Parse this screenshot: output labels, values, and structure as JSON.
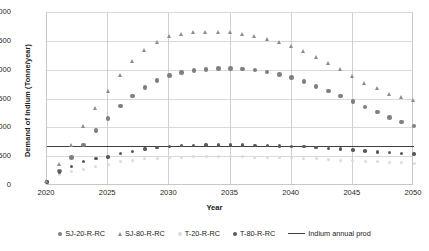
{
  "chart_data": {
    "type": "scatter",
    "title": "",
    "xlabel": "Year",
    "ylabel": "Demand of Indium  (Tonne/year)",
    "xlim": [
      2020,
      2050
    ],
    "ylim": [
      0,
      3000
    ],
    "ytick_step": 500,
    "xtick_step": 5,
    "grid": true,
    "legend_position": "bottom",
    "yticks": [
      "0",
      "500",
      "1000",
      "1500",
      "2000",
      "2500",
      "3000"
    ],
    "xticks": [
      "2020",
      "2025",
      "2030",
      "2035",
      "2040",
      "2045",
      "2050"
    ],
    "x": [
      2020,
      2021,
      2022,
      2023,
      2024,
      2025,
      2026,
      2027,
      2028,
      2029,
      2030,
      2031,
      2032,
      2033,
      2034,
      2035,
      2036,
      2037,
      2038,
      2039,
      2040,
      2041,
      2042,
      2043,
      2044,
      2045,
      2046,
      2047,
      2048,
      2049,
      2050
    ],
    "series": [
      {
        "name": "SJ-20-R-RC",
        "marker": "circle",
        "color": "#7f7f7f",
        "values": [
          70,
          260,
          490,
          710,
          960,
          1170,
          1390,
          1560,
          1710,
          1830,
          1915,
          1965,
          2000,
          2020,
          2035,
          2040,
          2030,
          2010,
          1975,
          1930,
          1880,
          1810,
          1730,
          1650,
          1560,
          1470,
          1370,
          1280,
          1190,
          1110,
          1040
        ]
      },
      {
        "name": "SJ-80-R-RC",
        "marker": "triangle",
        "color": "#8c8c8c",
        "values": [
          75,
          375,
          700,
          1040,
          1350,
          1640,
          1930,
          2160,
          2350,
          2495,
          2590,
          2640,
          2665,
          2670,
          2670,
          2665,
          2640,
          2600,
          2545,
          2490,
          2420,
          2330,
          2230,
          2130,
          2020,
          1910,
          1790,
          1690,
          1600,
          1545,
          1490
        ]
      },
      {
        "name": "T-20-R-RC",
        "marker": "circle",
        "color": "#dcdcdc",
        "values": [
          70,
          195,
          260,
          290,
          330,
          375,
          420,
          450,
          470,
          485,
          495,
          500,
          505,
          505,
          505,
          505,
          503,
          500,
          497,
          493,
          488,
          480,
          470,
          460,
          450,
          440,
          428,
          418,
          408,
          400,
          393
        ]
      },
      {
        "name": "T-80-R-RC",
        "marker": "circle",
        "color": "#595959",
        "values": [
          70,
          245,
          340,
          420,
          480,
          500,
          560,
          600,
          640,
          670,
          690,
          700,
          705,
          708,
          710,
          710,
          708,
          705,
          700,
          696,
          690,
          680,
          668,
          655,
          640,
          625,
          608,
          592,
          578,
          566,
          556
        ]
      }
    ],
    "hline": {
      "name": "Indium annual prod",
      "value": 700,
      "color": "#3f3f3f"
    },
    "legend": [
      {
        "label": "SJ-20-R-RC",
        "marker": "circle",
        "color": "#7f7f7f"
      },
      {
        "label": "SJ-80-R-RC",
        "marker": "triangle",
        "color": "#8c8c8c"
      },
      {
        "label": "T-20-R-RC",
        "marker": "circle",
        "color": "#dcdcdc"
      },
      {
        "label": "T-80-R-RC",
        "marker": "circle",
        "color": "#595959"
      },
      {
        "label": "Indium annual prod",
        "marker": "line",
        "color": "#3f3f3f"
      }
    ]
  }
}
